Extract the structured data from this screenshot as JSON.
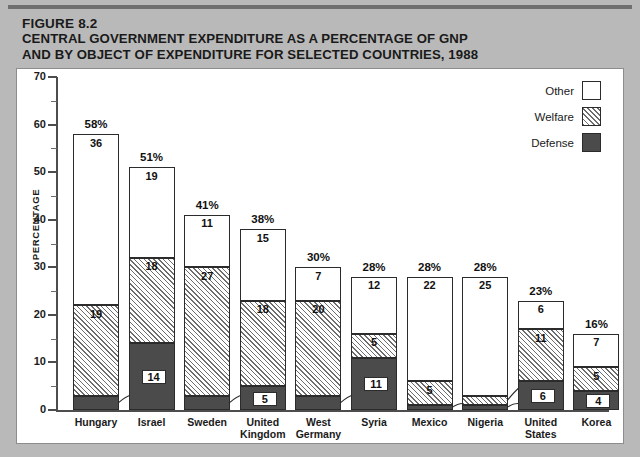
{
  "figure": {
    "number": "FIGURE 8.2",
    "title_line1": "CENTRAL GOVERNMENT EXPENDITURE AS A PERCENTAGE OF GNP",
    "title_line2": "AND BY OBJECT OF EXPENDITURE FOR SELECTED COUNTRIES, 1988"
  },
  "legend": {
    "items": [
      {
        "label": "Other",
        "swatch": "white-square-icon"
      },
      {
        "label": "Welfare",
        "swatch": "hatched-square-icon"
      },
      {
        "label": "Defense",
        "swatch": "dark-square-icon"
      }
    ]
  },
  "axis": {
    "ylabel": "PERCENTAGE",
    "yticks": [
      "0",
      "10",
      "20",
      "30",
      "40",
      "50",
      "60",
      "70"
    ]
  },
  "chart_data": {
    "type": "bar",
    "subtype": "stacked-vertical",
    "title": "CENTRAL GOVERNMENT EXPENDITURE AS A PERCENTAGE OF GNP AND BY OBJECT OF EXPENDITURE FOR SELECTED COUNTRIES, 1988",
    "xlabel": "",
    "ylabel": "PERCENTAGE",
    "ylim": [
      0,
      70
    ],
    "ytick_step": 10,
    "yminor_step": 5,
    "grid": false,
    "legend_position": "top-right",
    "categories": [
      "Hungary",
      "Israel",
      "Sweden",
      "United Kingdom",
      "West Germany",
      "Syria",
      "Mexico",
      "Nigeria",
      "United States",
      "Korea"
    ],
    "series": [
      {
        "name": "Defense",
        "values": [
          3,
          14,
          3,
          5,
          3,
          11,
          1,
          1,
          6,
          4
        ]
      },
      {
        "name": "Welfare",
        "values": [
          19,
          18,
          27,
          18,
          20,
          5,
          5,
          2,
          11,
          5
        ]
      },
      {
        "name": "Other",
        "values": [
          36,
          19,
          11,
          15,
          7,
          12,
          22,
          25,
          6,
          7
        ]
      }
    ],
    "totals": [
      "58%",
      "51%",
      "41%",
      "38%",
      "30%",
      "28%",
      "28%",
      "28%",
      "23%",
      "16%"
    ]
  },
  "bars": [
    {
      "name": "Hungary",
      "label_lines": [
        "Hungary"
      ],
      "total": "58%",
      "segments": [
        {
          "type": "other",
          "value": 36,
          "label": "36",
          "style": "inside-top"
        },
        {
          "type": "welfare",
          "value": 19,
          "label": "19",
          "style": "inside-top"
        },
        {
          "type": "defense",
          "value": 3,
          "label": "3",
          "style": "callout-right"
        }
      ]
    },
    {
      "name": "Israel",
      "label_lines": [
        "Israel"
      ],
      "total": "51%",
      "segments": [
        {
          "type": "other",
          "value": 19,
          "label": "19",
          "style": "inside-top"
        },
        {
          "type": "welfare",
          "value": 18,
          "label": "18",
          "style": "inside-top"
        },
        {
          "type": "defense",
          "value": 14,
          "label": "14",
          "style": "boxed"
        }
      ]
    },
    {
      "name": "Sweden",
      "label_lines": [
        "Sweden"
      ],
      "total": "41%",
      "segments": [
        {
          "type": "other",
          "value": 11,
          "label": "11",
          "style": "inside-top"
        },
        {
          "type": "welfare",
          "value": 27,
          "label": "27",
          "style": "inside-top"
        },
        {
          "type": "defense",
          "value": 3,
          "label": "3",
          "style": "callout-right"
        }
      ]
    },
    {
      "name": "United Kingdom",
      "label_lines": [
        "United",
        "Kingdom"
      ],
      "total": "38%",
      "segments": [
        {
          "type": "other",
          "value": 15,
          "label": "15",
          "style": "inside-top"
        },
        {
          "type": "welfare",
          "value": 18,
          "label": "18",
          "style": "inside-top"
        },
        {
          "type": "defense",
          "value": 5,
          "label": "5",
          "style": "boxed"
        }
      ]
    },
    {
      "name": "West Germany",
      "label_lines": [
        "West",
        "Germany"
      ],
      "total": "30%",
      "segments": [
        {
          "type": "other",
          "value": 7,
          "label": "7",
          "style": "inside-top"
        },
        {
          "type": "welfare",
          "value": 20,
          "label": "20",
          "style": "inside-top"
        },
        {
          "type": "defense",
          "value": 3,
          "label": "3",
          "style": "callout-right"
        }
      ]
    },
    {
      "name": "Syria",
      "label_lines": [
        "Syria"
      ],
      "total": "28%",
      "segments": [
        {
          "type": "other",
          "value": 12,
          "label": "12",
          "style": "inside-top"
        },
        {
          "type": "welfare",
          "value": 5,
          "label": "5",
          "style": "inside-top"
        },
        {
          "type": "defense",
          "value": 11,
          "label": "11",
          "style": "boxed"
        }
      ]
    },
    {
      "name": "Mexico",
      "label_lines": [
        "Mexico"
      ],
      "total": "28%",
      "segments": [
        {
          "type": "other",
          "value": 22,
          "label": "22",
          "style": "inside-top"
        },
        {
          "type": "welfare",
          "value": 5,
          "label": "5",
          "style": "inside-top"
        },
        {
          "type": "defense",
          "value": 1,
          "label": "1",
          "style": "callout-right"
        }
      ]
    },
    {
      "name": "Nigeria",
      "label_lines": [
        "Nigeria"
      ],
      "total": "28%",
      "segments": [
        {
          "type": "other",
          "value": 25,
          "label": "25",
          "style": "inside-top"
        },
        {
          "type": "welfare",
          "value": 2,
          "label": "2",
          "style": "callout-right-upper"
        },
        {
          "type": "defense",
          "value": 1,
          "label": "1",
          "style": "callout-right"
        }
      ]
    },
    {
      "name": "United States",
      "label_lines": [
        "United",
        "States"
      ],
      "total": "23%",
      "segments": [
        {
          "type": "other",
          "value": 6,
          "label": "6",
          "style": "inside-top"
        },
        {
          "type": "welfare",
          "value": 11,
          "label": "11",
          "style": "inside-top"
        },
        {
          "type": "defense",
          "value": 6,
          "label": "6",
          "style": "boxed"
        }
      ]
    },
    {
      "name": "Korea",
      "label_lines": [
        "Korea"
      ],
      "total": "16%",
      "segments": [
        {
          "type": "other",
          "value": 7,
          "label": "7",
          "style": "inside-top"
        },
        {
          "type": "welfare",
          "value": 5,
          "label": "5",
          "style": "inside-top"
        },
        {
          "type": "defense",
          "value": 4,
          "label": "4",
          "style": "boxed"
        }
      ]
    }
  ],
  "colors": {
    "background": "#b9b9b9",
    "panel": "#ffffff",
    "defense": "#4b4b4b",
    "hatch": "#6d6d6d",
    "outline": "#2b2b2b",
    "axis": "#4d4d4d",
    "text": "#1a1a1a"
  }
}
